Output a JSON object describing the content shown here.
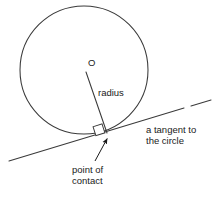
{
  "figure": {
    "type": "geometry-diagram",
    "background_color": "#ffffff",
    "stroke_color": "#3a3a3a",
    "text_color": "#1a1a1a",
    "width": 217,
    "height": 201
  },
  "labels": {
    "center": "O",
    "radius": "radius",
    "tangent_line_1": "a tangent to",
    "tangent_line_2": "the circle",
    "contact_line_1": "point of",
    "contact_line_2": "contact"
  },
  "geometry": {
    "circle": {
      "center_x": 84,
      "center_y": 70,
      "radius": 64
    },
    "radius_segment": {
      "x1": 86,
      "y1": 72,
      "x2": 107,
      "y2": 133
    },
    "tangent_segment": {
      "x1": 9,
      "y1": 161,
      "x2": 211,
      "y2": 100,
      "has_dash_gap": true
    },
    "right_angle_marker": {
      "x": 103,
      "y": 123,
      "size": 9
    },
    "point_of_contact": {
      "x": 107,
      "y": 134
    },
    "leader_arrow": {
      "x1": 95,
      "y1": 160,
      "x2": 108,
      "y2": 137
    }
  }
}
